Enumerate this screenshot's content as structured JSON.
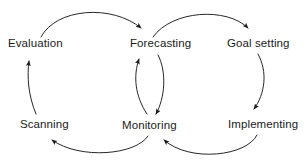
{
  "diagram": {
    "type": "cycle-flow-diagram",
    "stroke_color": "#1b1b1b",
    "text_color": "#1b1b1b",
    "background_color": "#ffffff",
    "nodes": [
      {
        "id": "evaluation",
        "label": "Evaluation"
      },
      {
        "id": "forecasting",
        "label": "Forecasting"
      },
      {
        "id": "goal_setting",
        "label": "Goal setting"
      },
      {
        "id": "scanning",
        "label": "Scanning"
      },
      {
        "id": "monitoring",
        "label": "Monitoring"
      },
      {
        "id": "implementing",
        "label": "Implementing"
      }
    ],
    "edges": [
      {
        "from": "evaluation",
        "to": "forecasting"
      },
      {
        "from": "forecasting",
        "to": "goal_setting"
      },
      {
        "from": "goal_setting",
        "to": "implementing"
      },
      {
        "from": "implementing",
        "to": "monitoring"
      },
      {
        "from": "monitoring",
        "to": "forecasting"
      },
      {
        "from": "forecasting",
        "to": "monitoring"
      },
      {
        "from": "monitoring",
        "to": "scanning"
      },
      {
        "from": "scanning",
        "to": "evaluation"
      }
    ]
  }
}
